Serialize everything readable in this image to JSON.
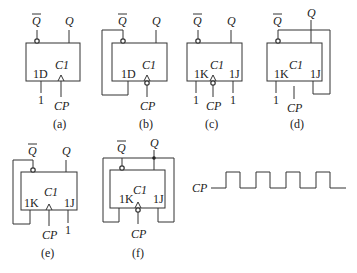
{
  "figure": {
    "type": "flip-flop circuit diagrams with clock waveform",
    "panels": [
      {
        "id": "a",
        "caption": "(a)",
        "type": "D",
        "inputs": {
          "1D": "1"
        },
        "clock": "CP",
        "clock_inverted": false,
        "labels": {
          "d": "1D",
          "clk": "C1",
          "q": "Q",
          "qbar": "Q",
          "one": "1",
          "cp": "CP"
        }
      },
      {
        "id": "b",
        "caption": "(b)",
        "type": "D",
        "inputs": {
          "1D": "Q̄ feedback"
        },
        "clock": "CP",
        "clock_inverted": true,
        "labels": {
          "d": "1D",
          "clk": "C1",
          "q": "Q",
          "qbar": "Q",
          "cp": "CP"
        }
      },
      {
        "id": "c",
        "caption": "(c)",
        "type": "JK",
        "inputs": {
          "1K": "1",
          "1J": "1"
        },
        "clock": "CP",
        "clock_inverted": true,
        "labels": {
          "k": "1K",
          "clk": "C1",
          "j": "1J",
          "q": "Q",
          "qbar": "Q",
          "one_k": "1",
          "one_j": "1",
          "cp": "CP"
        }
      },
      {
        "id": "d",
        "caption": "(d)",
        "type": "JK",
        "inputs": {
          "1K": "1",
          "1J": "Q feedback"
        },
        "clock": "CP",
        "clock_inverted": false,
        "clock_connected": false,
        "labels": {
          "k": "1K",
          "clk": "C1",
          "j": "1J",
          "q": "Q",
          "qbar": "Q",
          "one_k": "1",
          "cp": "CP"
        }
      },
      {
        "id": "e",
        "caption": "(e)",
        "type": "JK",
        "inputs": {
          "1K": "Q̄ feedback",
          "1J": "1"
        },
        "clock": "CP",
        "clock_inverted": false,
        "labels": {
          "k": "1K",
          "clk": "C1",
          "j": "1J",
          "q": "Q",
          "qbar": "Q",
          "one_j": "1",
          "cp": "CP"
        }
      },
      {
        "id": "f",
        "caption": "(f)",
        "type": "JK",
        "inputs": {
          "1K": "Q feedback",
          "1J": "Q̄ feedback"
        },
        "clock": "CP",
        "clock_inverted": true,
        "labels": {
          "k": "1K",
          "clk": "C1",
          "j": "1J",
          "q": "Q",
          "qbar": "Q",
          "cp": "CP"
        }
      }
    ],
    "waveform": {
      "label": "CP",
      "pulses": 4
    }
  }
}
